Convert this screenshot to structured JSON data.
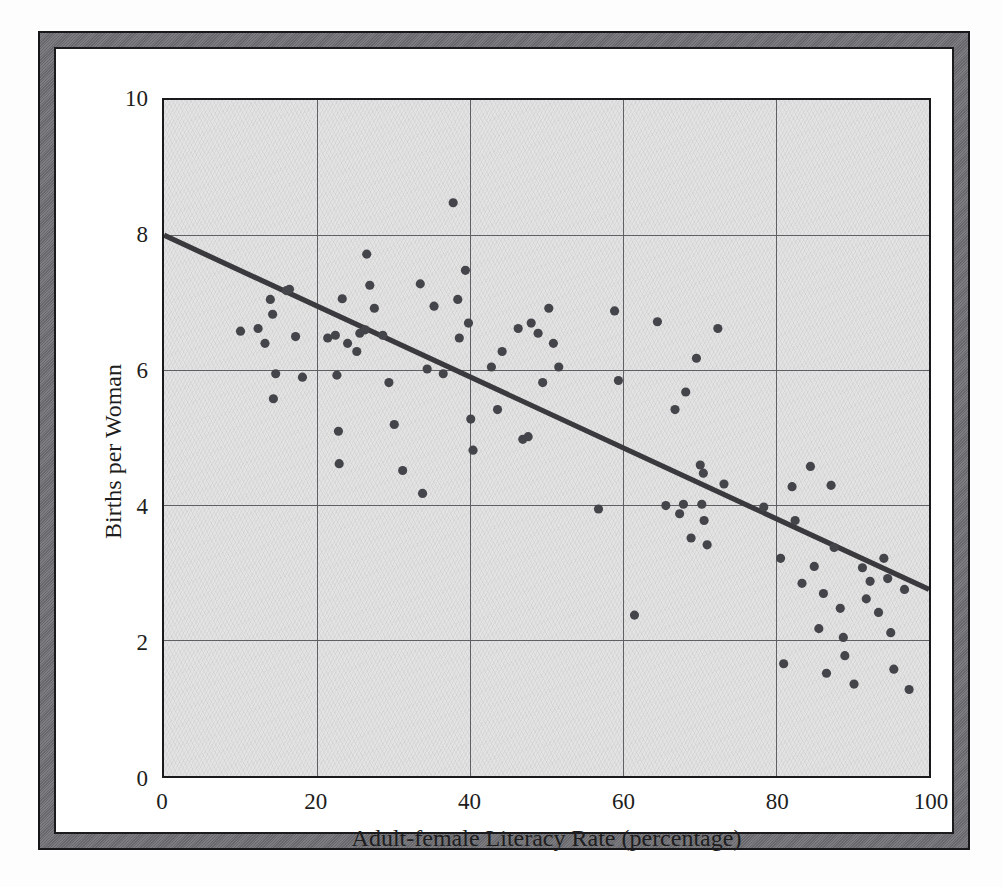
{
  "figure": {
    "frame_color": "#6e6e73",
    "frame_border_color": "#1b1b1e",
    "plot_background": "#e3e3e3"
  },
  "chart_data": {
    "type": "scatter",
    "title": "",
    "xlabel": "Adult-female Literacy Rate (percentage)",
    "ylabel": "Births per Woman",
    "xlim": [
      0,
      100
    ],
    "ylim": [
      0,
      10
    ],
    "xticks": [
      0,
      20,
      40,
      60,
      80,
      100
    ],
    "yticks": [
      0,
      2,
      4,
      6,
      8,
      10
    ],
    "xtick_labels": [
      "0",
      "20",
      "40",
      "60",
      "80",
      "100"
    ],
    "ytick_labels": [
      "0",
      "2",
      "4",
      "6",
      "8",
      "10"
    ],
    "grid": true,
    "grid_color": "#5e5e63",
    "legend": null,
    "point_color": "#44444b",
    "point_radius": 4.6,
    "trendline": {
      "type": "linear-fit",
      "color": "#3a3a3e",
      "width": 5.2,
      "x_start": 0,
      "y_start": 8.0,
      "x_end": 100,
      "y_end": 2.76,
      "slope": -0.0524,
      "intercept": 8.0
    },
    "series": [
      {
        "name": "Countries",
        "points": [
          [
            10.0,
            6.58
          ],
          [
            12.3,
            6.62
          ],
          [
            13.2,
            6.4
          ],
          [
            13.9,
            7.05
          ],
          [
            14.2,
            6.83
          ],
          [
            14.6,
            5.95
          ],
          [
            14.3,
            5.58
          ],
          [
            16.0,
            7.18
          ],
          [
            16.4,
            7.2
          ],
          [
            17.2,
            6.5
          ],
          [
            18.1,
            5.9
          ],
          [
            21.4,
            6.48
          ],
          [
            22.4,
            6.52
          ],
          [
            22.6,
            5.93
          ],
          [
            22.8,
            5.1
          ],
          [
            22.9,
            4.62
          ],
          [
            23.3,
            7.06
          ],
          [
            24.0,
            6.4
          ],
          [
            25.2,
            6.28
          ],
          [
            25.6,
            6.55
          ],
          [
            26.3,
            6.6
          ],
          [
            26.5,
            7.72
          ],
          [
            26.9,
            7.26
          ],
          [
            27.5,
            6.92
          ],
          [
            28.6,
            6.52
          ],
          [
            29.4,
            5.82
          ],
          [
            30.1,
            5.2
          ],
          [
            31.2,
            4.52
          ],
          [
            33.5,
            7.28
          ],
          [
            33.8,
            4.18
          ],
          [
            34.4,
            6.02
          ],
          [
            35.3,
            6.95
          ],
          [
            36.5,
            5.95
          ],
          [
            37.8,
            8.48
          ],
          [
            38.4,
            7.05
          ],
          [
            38.6,
            6.48
          ],
          [
            39.4,
            7.48
          ],
          [
            39.8,
            6.7
          ],
          [
            40.1,
            5.28
          ],
          [
            40.4,
            4.82
          ],
          [
            42.8,
            6.05
          ],
          [
            43.6,
            5.42
          ],
          [
            44.2,
            6.28
          ],
          [
            46.3,
            6.62
          ],
          [
            46.9,
            4.98
          ],
          [
            47.6,
            5.02
          ],
          [
            48.0,
            6.7
          ],
          [
            48.9,
            6.55
          ],
          [
            49.5,
            5.82
          ],
          [
            50.3,
            6.92
          ],
          [
            50.9,
            6.4
          ],
          [
            51.6,
            6.05
          ],
          [
            56.8,
            3.95
          ],
          [
            58.9,
            6.88
          ],
          [
            59.4,
            5.85
          ],
          [
            61.5,
            2.38
          ],
          [
            64.5,
            6.72
          ],
          [
            65.6,
            4.0
          ],
          [
            66.8,
            5.42
          ],
          [
            67.4,
            3.88
          ],
          [
            67.9,
            4.02
          ],
          [
            68.2,
            5.68
          ],
          [
            68.9,
            3.52
          ],
          [
            69.6,
            6.18
          ],
          [
            70.1,
            4.6
          ],
          [
            70.3,
            4.02
          ],
          [
            70.5,
            4.48
          ],
          [
            70.6,
            3.78
          ],
          [
            71.0,
            3.42
          ],
          [
            72.4,
            6.62
          ],
          [
            73.2,
            4.32
          ],
          [
            78.4,
            3.98
          ],
          [
            80.6,
            3.22
          ],
          [
            81.0,
            1.66
          ],
          [
            82.1,
            4.28
          ],
          [
            82.5,
            3.78
          ],
          [
            83.4,
            2.85
          ],
          [
            84.5,
            4.58
          ],
          [
            85.0,
            3.1
          ],
          [
            85.6,
            2.18
          ],
          [
            86.2,
            2.7
          ],
          [
            86.6,
            1.52
          ],
          [
            87.2,
            4.3
          ],
          [
            87.6,
            3.38
          ],
          [
            88.4,
            2.48
          ],
          [
            88.8,
            2.05
          ],
          [
            89.0,
            1.78
          ],
          [
            90.2,
            1.36
          ],
          [
            91.3,
            3.08
          ],
          [
            91.8,
            2.62
          ],
          [
            92.3,
            2.88
          ],
          [
            93.4,
            2.42
          ],
          [
            94.1,
            3.22
          ],
          [
            94.6,
            2.92
          ],
          [
            95.0,
            2.12
          ],
          [
            95.4,
            1.58
          ],
          [
            96.8,
            2.76
          ],
          [
            97.4,
            1.28
          ]
        ]
      }
    ]
  }
}
